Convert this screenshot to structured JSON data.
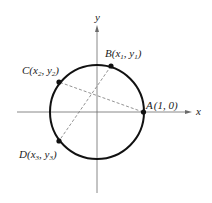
{
  "figure": {
    "type": "unit circle with points and chords",
    "axes": {
      "x_label": "x",
      "y_label": "y"
    },
    "points": [
      {
        "id": "A",
        "name": "A",
        "coords": "(1, 0)",
        "x_sub": "",
        "y_sub": ""
      },
      {
        "id": "B",
        "name": "B",
        "x_var": "x",
        "x_sub": "1",
        "y_var": "y",
        "y_sub": "1"
      },
      {
        "id": "C",
        "name": "C",
        "x_var": "x",
        "x_sub": "2",
        "y_var": "y",
        "y_sub": "2"
      },
      {
        "id": "D",
        "name": "D",
        "x_var": "x",
        "x_sub": "3",
        "y_var": "y",
        "y_sub": "3"
      }
    ],
    "segments": [
      {
        "from": "A",
        "to": "C",
        "style": "dashed"
      },
      {
        "from": "B",
        "to": "D",
        "style": "dashed"
      }
    ],
    "colors": {
      "stroke": "#111111",
      "axis": "#555555",
      "dashed": "#777777",
      "background": "#ffffff"
    }
  }
}
